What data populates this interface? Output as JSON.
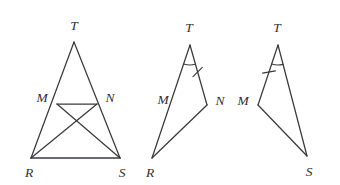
{
  "figure": {
    "background_color": "#ffffff",
    "stroke_color": "#3a3a3c",
    "base_stroke_color": "#6b6b6f",
    "label_color": "#303033"
  },
  "figures": [
    {
      "id": "figure-1",
      "name": "triangle-TRS-with-cevians",
      "labels": {
        "apex": "T",
        "left_point": "M",
        "right_point": "N",
        "bottom_left": "R",
        "bottom_right": "S"
      },
      "points": {
        "T": {
          "x": 74,
          "y": 42
        },
        "M": {
          "x": 57,
          "y": 104
        },
        "N": {
          "x": 97,
          "y": 104
        },
        "R": {
          "x": 31,
          "y": 158
        },
        "S": {
          "x": 120,
          "y": 158
        }
      },
      "label_positions": {
        "T": {
          "x": 74,
          "y": 27
        },
        "M": {
          "x": 42,
          "y": 99
        },
        "N": {
          "x": 110,
          "y": 99
        },
        "R": {
          "x": 29,
          "y": 174
        },
        "S": {
          "x": 122,
          "y": 174
        }
      },
      "segments": [
        {
          "name": "segment-TR",
          "from": "T",
          "to": "R",
          "style": "thin"
        },
        {
          "name": "segment-TS",
          "from": "T",
          "to": "S",
          "style": "thin"
        },
        {
          "name": "segment-RS",
          "from": "R",
          "to": "S",
          "style": "base"
        },
        {
          "name": "segment-MN",
          "from": "M",
          "to": "N",
          "style": "thin"
        },
        {
          "name": "segment-MS",
          "from": "M",
          "to": "S",
          "style": "thin"
        },
        {
          "name": "segment-NR",
          "from": "N",
          "to": "R",
          "style": "thin"
        }
      ],
      "marks": []
    },
    {
      "id": "figure-2",
      "name": "triangle-TRN",
      "labels": {
        "apex": "T",
        "side_left": "M",
        "right_point": "N",
        "bottom_left": "R"
      },
      "points": {
        "T": {
          "x": 190,
          "y": 45
        },
        "N": {
          "x": 207,
          "y": 105
        },
        "R": {
          "x": 152,
          "y": 158
        }
      },
      "label_positions": {
        "T": {
          "x": 189,
          "y": 29
        },
        "M": {
          "x": 163,
          "y": 101
        },
        "N": {
          "x": 220,
          "y": 102
        },
        "R": {
          "x": 150,
          "y": 174
        }
      },
      "segments": [
        {
          "name": "segment-TR",
          "from": "T",
          "to": "R",
          "style": "thin"
        },
        {
          "name": "segment-TN",
          "from": "T",
          "to": "N",
          "style": "thin"
        },
        {
          "name": "segment-RN",
          "from": "R",
          "to": "N",
          "style": "thin"
        }
      ],
      "marks": [
        {
          "name": "angle-arc-T",
          "type": "arc",
          "at": "T",
          "radius": 20
        },
        {
          "name": "tick-mark-TN",
          "type": "tick",
          "on": "TN",
          "position": 0.45
        }
      ]
    },
    {
      "id": "figure-3",
      "name": "triangle-TMS",
      "labels": {
        "apex": "T",
        "left_point": "M",
        "bottom_right": "S"
      },
      "points": {
        "T": {
          "x": 278,
          "y": 45
        },
        "M": {
          "x": 258,
          "y": 105
        },
        "S": {
          "x": 307,
          "y": 156
        }
      },
      "label_positions": {
        "T": {
          "x": 277,
          "y": 29
        },
        "M": {
          "x": 243,
          "y": 102
        },
        "S": {
          "x": 309,
          "y": 173
        }
      },
      "segments": [
        {
          "name": "segment-TM",
          "from": "T",
          "to": "M",
          "style": "thin"
        },
        {
          "name": "segment-TS",
          "from": "T",
          "to": "S",
          "style": "thin"
        },
        {
          "name": "segment-MS",
          "from": "M",
          "to": "S",
          "style": "thin"
        }
      ],
      "marks": [
        {
          "name": "angle-arc-T",
          "type": "arc",
          "at": "T",
          "radius": 20
        },
        {
          "name": "tick-mark-TM",
          "type": "tick",
          "on": "TM",
          "position": 0.45
        }
      ]
    }
  ]
}
